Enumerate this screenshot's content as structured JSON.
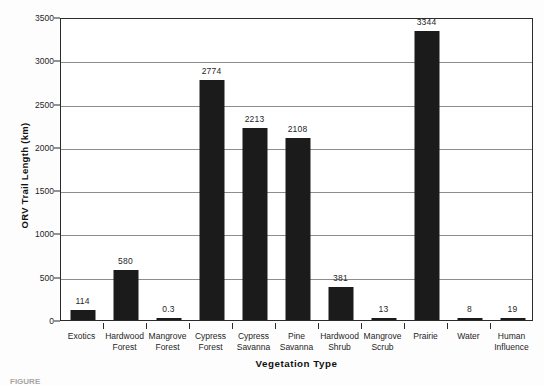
{
  "chart_data": {
    "type": "bar",
    "title": "",
    "xlabel": "Vegetation Type",
    "ylabel": "ORV Trail Length (km)",
    "ylim": [
      0,
      3500
    ],
    "ytick_step": 500,
    "yticks": [
      "0",
      "500",
      "1000",
      "1500",
      "2000",
      "2500",
      "3000",
      "3500"
    ],
    "grid": "horizontal",
    "legend": "none",
    "bar_color": "#1b1b1b",
    "categories": [
      "Exotics",
      "Hardwood Forest",
      "Mangrove Forest",
      "Cypress Forest",
      "Cypress Savanna",
      "Pine Savanna",
      "Hardwood Shrub",
      "Mangrove Scrub",
      "Prairie",
      "Water",
      "Human Influence"
    ],
    "category_lines": [
      [
        "Exotics"
      ],
      [
        "Hardwood",
        "Forest"
      ],
      [
        "Mangrove",
        "Forest"
      ],
      [
        "Cypress",
        "Forest"
      ],
      [
        "Cypress",
        "Savanna"
      ],
      [
        "Pine",
        "Savanna"
      ],
      [
        "Hardwood",
        "Shrub"
      ],
      [
        "Mangrove",
        "Scrub"
      ],
      [
        "Prairie"
      ],
      [
        "Water"
      ],
      [
        "Human",
        "Influence"
      ]
    ],
    "values": [
      114,
      580,
      0.3,
      2774,
      2213,
      2108,
      381,
      13,
      3344,
      8,
      19
    ],
    "value_labels": [
      "114",
      "580",
      "0.3",
      "2774",
      "2213",
      "2108",
      "381",
      "13",
      "3344",
      "8",
      "19"
    ]
  },
  "caption": {
    "text": "FIGURE"
  }
}
